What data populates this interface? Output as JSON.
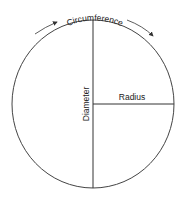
{
  "diagram": {
    "labels": {
      "circumference": "Circumference",
      "diameter": "Diameter",
      "radius": "Radius"
    },
    "colors": {
      "stroke": "#333333",
      "background": "#ffffff"
    }
  }
}
